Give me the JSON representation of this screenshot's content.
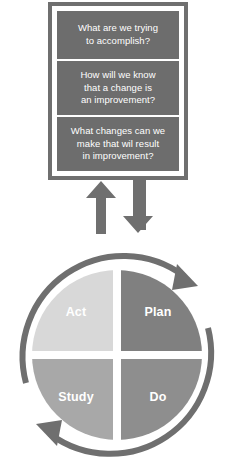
{
  "diagram": {
    "sign": {
      "questions": [
        "What are we trying\nto accomplish?",
        "How will we know\nthat a change is\nan improvement?",
        "What changes can we\nmake that wil result\nin improvement?"
      ],
      "frame_color": "#6f6f6f",
      "box_color": "#6d6d6d",
      "text_color": "#ffffff"
    },
    "connectors": {
      "up_arrow": "arrow-up",
      "down_arrow": "arrow-down",
      "color": "#6f6f6f"
    },
    "cycle": {
      "ring_color": "#6f6f6f",
      "divider_color": "#ffffff",
      "label_color": "#ffffff",
      "rotation_direction": "clockwise",
      "quadrants": [
        {
          "label": "Plan",
          "position": "top-right",
          "color": "#808080"
        },
        {
          "label": "Do",
          "position": "bottom-right",
          "color": "#8e8e8e"
        },
        {
          "label": "Study",
          "position": "bottom-left",
          "color": "#a8a8a8"
        },
        {
          "label": "Act",
          "position": "top-left",
          "color": "#d8d8d8"
        }
      ]
    }
  }
}
